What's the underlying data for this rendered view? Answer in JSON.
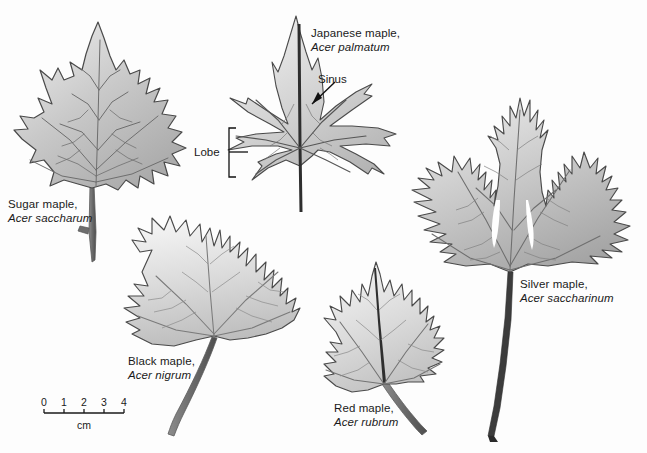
{
  "figure": {
    "background_color": "#fdfdfd",
    "ink_color": "#1a1a1a",
    "leaf_outline_color": "#4a4a4a",
    "vein_color": "#6b6b6b"
  },
  "leaves": [
    {
      "id": "sugar-maple",
      "common_name": "Sugar maple,",
      "scientific_name": "Acer saccharum",
      "label_x": 8,
      "label_y": 198,
      "fill_light": "#e8e8e8",
      "fill_dark": "#a8a8a8"
    },
    {
      "id": "japanese-maple",
      "common_name": "Japanese maple,",
      "scientific_name": "Acer palmatum",
      "label_x": 311,
      "label_y": 27,
      "fill_light": "#ececec",
      "fill_dark": "#b4b4b4"
    },
    {
      "id": "silver-maple",
      "common_name": "Silver maple,",
      "scientific_name": "Acer saccharinum",
      "label_x": 520,
      "label_y": 278,
      "fill_light": "#e4e4e4",
      "fill_dark": "#a4a4a4"
    },
    {
      "id": "black-maple",
      "common_name": "Black maple,",
      "scientific_name": "Acer nigrum",
      "label_x": 128,
      "label_y": 355,
      "fill_light": "#f0f0f0",
      "fill_dark": "#bcbcbc"
    },
    {
      "id": "red-maple",
      "common_name": "Red maple,",
      "scientific_name": "Acer rubrum",
      "label_x": 334,
      "label_y": 402,
      "fill_light": "#efefef",
      "fill_dark": "#bdbdbd"
    }
  ],
  "annotations": [
    {
      "id": "sinus",
      "text": "Sinus",
      "x": 318,
      "y": 73
    },
    {
      "id": "lobe",
      "text": "Lobe",
      "x": 194,
      "y": 146
    }
  ],
  "scale_bar": {
    "ticks": [
      "0",
      "1",
      "2",
      "3",
      "4"
    ],
    "unit_label": "cm",
    "x_start": 44,
    "x_end": 124,
    "y_axis": 413,
    "label_y": 396,
    "unit_y": 419
  }
}
